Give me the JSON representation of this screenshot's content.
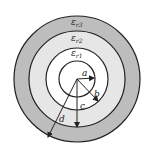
{
  "diagram": {
    "regions": [
      {
        "label": "εr3",
        "fill": "#bdbdbd"
      },
      {
        "label": "εr2",
        "fill": "#e6e6e6"
      },
      {
        "label": "εr1",
        "fill": "#ffffff"
      }
    ],
    "radii_labels": {
      "a": "a",
      "b": "b",
      "c": "c",
      "d": "d"
    },
    "layer_labels": {
      "r1": "ε",
      "r1_sub": "r1",
      "r2": "ε",
      "r2_sub": "r2",
      "r3": "ε",
      "r3_sub": "r3"
    }
  }
}
